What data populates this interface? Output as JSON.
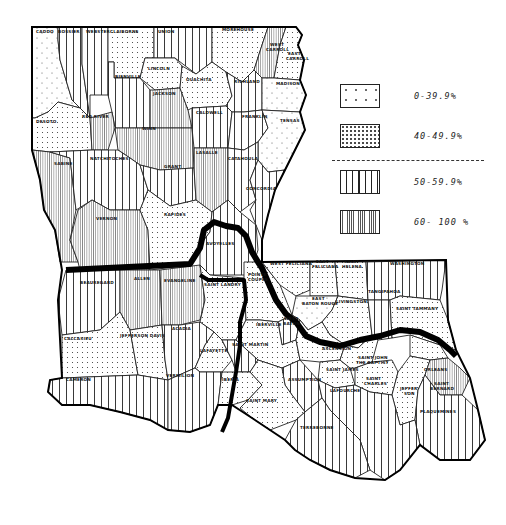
{
  "map": {
    "subject": "Louisiana parishes",
    "legend": {
      "items": [
        {
          "label": "0-39.9%",
          "pattern": "sparse-dots"
        },
        {
          "label": "40-49.9%",
          "pattern": "dense-dots"
        },
        {
          "label": "50-59.9%",
          "pattern": "wide-vertical-lines"
        },
        {
          "label": "60- 100 %",
          "pattern": "fine-vertical-lines"
        }
      ]
    },
    "parishes": [
      {
        "name": "CADDO",
        "class": "0-39.9%"
      },
      {
        "name": "BOSSIER",
        "class": "50-59.9%"
      },
      {
        "name": "WEBSTER",
        "class": "50-59.9%"
      },
      {
        "name": "CLAIBORNE",
        "class": "40-49.9%"
      },
      {
        "name": "UNION",
        "class": "50-59.9%"
      },
      {
        "name": "MOREHOUSE",
        "class": "40-49.9%"
      },
      {
        "name": "WEST CARROLL",
        "class": "60- 100 %"
      },
      {
        "name": "EAST CARROLL",
        "class": "40-49.9%"
      },
      {
        "name": "LINCOLN",
        "class": "40-49.9%"
      },
      {
        "name": "OUACHITA",
        "class": "40-49.9%"
      },
      {
        "name": "RICHLAND",
        "class": "50-59.9%"
      },
      {
        "name": "MADISON",
        "class": "0-39.9%"
      },
      {
        "name": "BIENVILLE",
        "class": "50-59.9%"
      },
      {
        "name": "JACKSON",
        "class": "60- 100 %"
      },
      {
        "name": "CALDWELL",
        "class": "50-59.9%"
      },
      {
        "name": "FRANKLIN",
        "class": "50-59.9%"
      },
      {
        "name": "TENSAS",
        "class": "0-39.9%"
      },
      {
        "name": "DESOTO",
        "class": "40-49.9%"
      },
      {
        "name": "RED RIVER",
        "class": "60- 100 %"
      },
      {
        "name": "WINN",
        "class": "60- 100 %"
      },
      {
        "name": "NATCHITOCHES",
        "class": "50-59.9%"
      },
      {
        "name": "GRANT",
        "class": "50-59.9%"
      },
      {
        "name": "LASALLE",
        "class": "60- 100 %"
      },
      {
        "name": "CATAHOULA",
        "class": "50-59.9%"
      },
      {
        "name": "CONCORDIA",
        "class": "50-59.9%"
      },
      {
        "name": "SABINE",
        "class": "60- 100 %"
      },
      {
        "name": "VERNON",
        "class": "60- 100 %"
      },
      {
        "name": "RAPIDES",
        "class": "40-49.9%"
      },
      {
        "name": "AVOYELLES",
        "class": "50-59.9%"
      },
      {
        "name": "BEAUREGARD",
        "class": "50-59.9%"
      },
      {
        "name": "ALLEN",
        "class": "60- 100 %"
      },
      {
        "name": "EVANGELINE",
        "class": "60- 100 %"
      },
      {
        "name": "SAINT LANDRY",
        "class": "40-49.9%"
      },
      {
        "name": "POINTE COUPEE",
        "class": "40-49.9%"
      },
      {
        "name": "WEST FELICIANA",
        "class": "40-49.9%"
      },
      {
        "name": "EAST FELICIANA",
        "class": "40-49.9%"
      },
      {
        "name": "SAINT HELENA",
        "class": "40-49.9%"
      },
      {
        "name": "WASHINGTON",
        "class": "50-59.9%"
      },
      {
        "name": "EAST BATON ROUGE",
        "class": "0-39.9%"
      },
      {
        "name": "WEST BATON ROUGE",
        "class": "40-49.9%"
      },
      {
        "name": "LIVINGSTON",
        "class": "40-49.9%"
      },
      {
        "name": "TANGIPAHOA",
        "class": "50-59.9%"
      },
      {
        "name": "SAINT TAMMANY",
        "class": "40-49.9%"
      },
      {
        "name": "IBERVILLE",
        "class": "40-49.9%"
      },
      {
        "name": "CALCASIEU",
        "class": "40-49.9%"
      },
      {
        "name": "JEFFERSON DAVIS",
        "class": "40-49.9%"
      },
      {
        "name": "ACADIA",
        "class": "50-59.9%"
      },
      {
        "name": "LAFAYETTE",
        "class": "40-49.9%"
      },
      {
        "name": "SAINT MARTIN",
        "class": "50-59.9%"
      },
      {
        "name": "ASCENSION",
        "class": "40-49.9%"
      },
      {
        "name": "SAINT JOHN THE BAPTIST",
        "class": "40-49.9%"
      },
      {
        "name": "SAINT JAMES",
        "class": "40-49.9%"
      },
      {
        "name": "ORLEANS",
        "class": "40-49.9%"
      },
      {
        "name": "CAMERON",
        "class": "50-59.9%"
      },
      {
        "name": "VERMILION",
        "class": "50-59.9%"
      },
      {
        "name": "IBERIA",
        "class": "40-49.9%"
      },
      {
        "name": "SAINT MARY",
        "class": "40-49.9%"
      },
      {
        "name": "ASSUMPTION",
        "class": "50-59.9%"
      },
      {
        "name": "SAINT CHARLES",
        "class": "40-49.9%"
      },
      {
        "name": "JEFFERSON",
        "class": "40-49.9%"
      },
      {
        "name": "SAINT BERNARD",
        "class": "60- 100 %"
      },
      {
        "name": "PLAQUEMINES",
        "class": "50-59.9%"
      },
      {
        "name": "LAFOURCHE",
        "class": "50-59.9%"
      },
      {
        "name": "TERREBONNE",
        "class": "50-59.9%"
      }
    ],
    "labels": {
      "caddo": "CADDO",
      "bossier": "BOSSIER",
      "webster": "WEBSTER",
      "claiborne": "CLAIBORNE",
      "union": "UNION",
      "morehouse": "MOREHOUSE",
      "west_carroll_1": "WEST",
      "west_carroll_2": "CARROLL",
      "east_carroll_1": "EAST",
      "east_carroll_2": "CARROLL",
      "lincoln": "LINCOLN",
      "ouachita": "OUACHITA",
      "richland": "RICHLAND",
      "madison": "MADISON",
      "bienville": "BIENVILLE",
      "jackson": "JACKSON",
      "caldwell": "CALDWELL",
      "franklin": "FRANKLIN",
      "tensas": "TENSAS",
      "desoto": "DESOTO",
      "red_river": "RED RIVER",
      "winn": "WINN",
      "natchitoches": "NATCHITOCHES",
      "grant": "GRANT",
      "lasalle": "LASALLE",
      "catahoula": "CATAHOULA",
      "concordia": "CONCORDIA",
      "sabine": "SABINE",
      "vernon": "VERNON",
      "rapides": "RAPIDES",
      "avoyelles": "AVOYELLES",
      "beauregard": "BEAUREGARD",
      "allen": "ALLEN",
      "evangeline": "EVANGELINE",
      "saint_landry": "SAINT LANDRY",
      "pointe_coupee_1": "POINTE",
      "pointe_coupee_2": "COUPEE",
      "west_feliciana": "WEST FELICIANA",
      "east_feliciana_1": "EAST",
      "east_feliciana_2": "FELICIANA",
      "saint_helena_1": "SAINT",
      "saint_helena_2": "HELENA",
      "washington": "WASHINGTON",
      "ebr_1": "EAST",
      "ebr_2": "BATON ROUGE",
      "wbr_1": "WEST",
      "wbr_2": "BATON",
      "livingston": "LIVINGSTON",
      "tangipahoa": "TANGIPAHOA",
      "saint_tammany": "SAINT TAMMANY",
      "iberville": "IBERVILLE",
      "calcasieu": "CALCASIEU",
      "jefferson_davis": "JEFFERSON DAVIS",
      "acadia": "ACADIA",
      "lafayette": "LAFAYETTE",
      "saint_martin": "SAINT MARTIN",
      "ascension": "ASCENSION",
      "sjb_1": "SAINT JOHN",
      "sjb_2": "THE BAPTIST",
      "saint_james": "SAINT JAMES",
      "orleans": "ORLEANS",
      "cameron": "CAMERON",
      "vermilion": "VERMILION",
      "iberia": "IBERIA",
      "saint_mary": "SAINT MARY",
      "assumption": "ASSUMPTION",
      "saint_charles_1": "SAINT",
      "saint_charles_2": "CHARLES",
      "jefferson_1": "JEFFER-",
      "jefferson_2": "SON",
      "saint_bernard_1": "SAINT",
      "saint_bernard_2": "BERNARD",
      "plaquemines": "PLAQUEMINES",
      "lafourche": "LAFOURCHE",
      "terrebonne": "TERREBONNE"
    }
  }
}
